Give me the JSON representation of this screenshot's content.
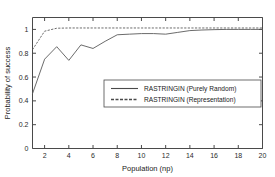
{
  "chart_data": {
    "type": "line",
    "title": "",
    "xlabel": "Population (np)",
    "ylabel": "Probability of success",
    "xlim": [
      1,
      20
    ],
    "ylim": [
      0,
      1.1
    ],
    "grid": false,
    "legend_position": "center-right",
    "x": [
      1,
      2,
      3,
      4,
      5,
      6,
      7,
      8,
      9,
      10,
      11,
      12,
      13,
      14,
      15,
      16,
      17,
      18,
      19,
      20
    ],
    "xticks": [
      2,
      4,
      6,
      8,
      10,
      12,
      14,
      16,
      18,
      20
    ],
    "xticklabels": [
      "2",
      "4",
      "6",
      "8",
      "10",
      "12",
      "14",
      "16",
      "18",
      "20"
    ],
    "yticks": [
      0,
      0.2,
      0.4,
      0.6,
      0.8,
      1
    ],
    "yticklabels": [
      "0",
      "0.2",
      "0.4",
      "0.6",
      "0.8",
      "1"
    ],
    "series": [
      {
        "name": "RASTRINGIN (Purely Random)",
        "style": "solid",
        "values": [
          0.46,
          0.75,
          0.855,
          0.74,
          0.87,
          0.84,
          0.9,
          0.955,
          0.96,
          0.965,
          0.965,
          0.96,
          0.975,
          0.99,
          0.995,
          0.998,
          1.0,
          1.0,
          1.0,
          1.0
        ]
      },
      {
        "name": "RASTRINGIN (Representation)",
        "style": "dashed",
        "values": [
          0.83,
          0.985,
          1.01,
          1.012,
          1.012,
          1.012,
          1.012,
          1.012,
          1.012,
          1.012,
          1.012,
          1.012,
          1.012,
          1.012,
          1.012,
          1.012,
          1.012,
          1.012,
          1.012,
          1.012
        ]
      }
    ]
  },
  "legend": {
    "entries": [
      {
        "label": "RASTRINGIN (Purely Random)",
        "style": "solid"
      },
      {
        "label": "RASTRINGIN (Representation)",
        "style": "dashed"
      }
    ]
  },
  "colors": {
    "axis": "#4a4a4a",
    "series": "#5a5a5a",
    "background": "#ffffff",
    "text": "#1a1a1a"
  }
}
